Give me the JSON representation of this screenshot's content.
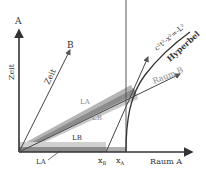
{
  "diagram": {
    "axes": {
      "time_A_label": "A",
      "time_A_axis_label": "Zeit",
      "time_B_label": "B",
      "time_B_axis_label": "Zeit",
      "space_A_label": "Raum A",
      "space_B_label": "Raum B"
    },
    "hyperbola": {
      "label": "Hyperbel",
      "equation": "c²t²-x²=-L²"
    },
    "bars": {
      "rest_bar_top_label": "LB",
      "rest_bar_top_sub": "B",
      "rest_bar_bottom_label": "LA",
      "rest_bar_bottom_sub": "A",
      "moving_bar_top_label": "LA",
      "moving_bar_top_sub": "A",
      "moving_bar_bottom_label": "LB",
      "moving_bar_bottom_sub": "B"
    },
    "markers": {
      "xB_label": "x",
      "xB_sub": "B",
      "xA_label": "x",
      "xA_sub": "A"
    },
    "colors": {
      "axis": "#333333",
      "bar_dark": "#8c8c8c",
      "bar_light": "#c8c8c8",
      "label_gray": "#8a8a8a"
    }
  }
}
